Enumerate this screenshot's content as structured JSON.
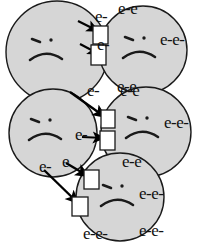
{
  "figure": {
    "background_color": "#ffffff",
    "width": 203,
    "height": 245
  },
  "style": {
    "circle_fill": "#d6d6d6",
    "circle_stroke": "#1a1a1a",
    "face_color": "#1a1a1a",
    "arrow_color": "#000000",
    "receptor_fill": "#ffffff",
    "receptor_stroke": "#1a1a1a",
    "label_color": "#111111"
  },
  "particles": [
    {
      "id": "particle-top-left",
      "name": "top-left-particle",
      "expression": "sad",
      "cx": 57,
      "cy": 52,
      "r": 51,
      "labels": [
        {
          "text": "e-",
          "x": 95,
          "y": 22,
          "size": "normal"
        },
        {
          "text": "e-",
          "x": 97,
          "y": 50,
          "size": "normal"
        },
        {
          "text": "e-",
          "x": 87,
          "y": 96,
          "size": "normal"
        }
      ]
    },
    {
      "id": "particle-top-right",
      "name": "top-right-particle",
      "expression": "sad",
      "cx": 143,
      "cy": 50,
      "r": 44,
      "labels": [
        {
          "text": "e-e",
          "x": 118,
          "y": 14,
          "size": "normal"
        },
        {
          "text": "e-e-",
          "x": 160,
          "y": 45,
          "size": "normal"
        },
        {
          "text": "e-e",
          "x": 117,
          "y": 92,
          "size": "normal"
        }
      ]
    },
    {
      "id": "particle-middle-left",
      "name": "middle-left-particle",
      "expression": "sad",
      "cx": 53,
      "cy": 133,
      "r": 44,
      "labels": [
        {
          "text": "e-",
          "x": 75,
          "y": 140,
          "size": "normal"
        },
        {
          "text": "e-",
          "x": 39,
          "y": 172,
          "size": "normal"
        },
        {
          "text": "e",
          "x": 62,
          "y": 167,
          "size": "normal"
        }
      ]
    },
    {
      "id": "particle-middle-right",
      "name": "middle-right-particle",
      "expression": "sad",
      "cx": 146,
      "cy": 132,
      "r": 45,
      "labels": [
        {
          "text": "e-e",
          "x": 120,
          "y": 96,
          "size": "normal"
        },
        {
          "text": "e-e-",
          "x": 164,
          "y": 128,
          "size": "normal"
        },
        {
          "text": "e-e",
          "x": 122,
          "y": 167,
          "size": "normal"
        }
      ]
    },
    {
      "id": "particle-bottom",
      "name": "bottom-particle",
      "expression": "sad",
      "cx": 120,
      "cy": 197,
      "r": 44,
      "labels": [
        {
          "text": "e-e-",
          "x": 139,
          "y": 199,
          "size": "normal"
        },
        {
          "text": "e-e-",
          "x": 83,
          "y": 239,
          "size": "normal"
        },
        {
          "text": "e-e-",
          "x": 139,
          "y": 236,
          "size": "normal"
        }
      ]
    }
  ],
  "receptors": [
    {
      "id": "receptor-1",
      "name": "receptor-box-top-right-upper",
      "x": 93,
      "y": 26,
      "w": 15,
      "h": 18
    },
    {
      "id": "receptor-2",
      "name": "receptor-box-top-right-lower",
      "x": 91,
      "y": 45,
      "w": 15,
      "h": 20
    },
    {
      "id": "receptor-3",
      "name": "receptor-box-middle-right-upper",
      "x": 101,
      "y": 110,
      "w": 14,
      "h": 18
    },
    {
      "id": "receptor-4",
      "name": "receptor-box-middle-right-lower",
      "x": 100,
      "y": 131,
      "w": 15,
      "h": 19
    },
    {
      "id": "receptor-5",
      "name": "receptor-box-bottom-upper",
      "x": 84,
      "y": 170,
      "w": 15,
      "h": 19
    },
    {
      "id": "receptor-6",
      "name": "receptor-box-bottom-lower",
      "x": 72,
      "y": 197,
      "w": 16,
      "h": 19
    }
  ],
  "transfers": [
    {
      "id": "transfer-1",
      "name": "electron-arrow-1",
      "from": "top-left-particle",
      "to": "top-right-particle",
      "x1": 78,
      "y1": 21,
      "x2": 98,
      "y2": 31
    },
    {
      "id": "transfer-2",
      "name": "electron-arrow-2",
      "from": "top-left-particle",
      "to": "top-right-particle",
      "x1": 80,
      "y1": 44,
      "x2": 99,
      "y2": 54
    },
    {
      "id": "transfer-3",
      "name": "electron-arrow-3",
      "from": "top-left-particle",
      "to": "middle-right-particle",
      "x1": 70,
      "y1": 92,
      "x2": 105,
      "y2": 117
    },
    {
      "id": "transfer-4",
      "name": "electron-arrow-4",
      "from": "middle-left-particle",
      "to": "middle-right-particle",
      "x1": 82,
      "y1": 137,
      "x2": 104,
      "y2": 138
    },
    {
      "id": "transfer-5",
      "name": "electron-arrow-5",
      "from": "middle-left-particle",
      "to": "bottom-particle",
      "x1": 66,
      "y1": 163,
      "x2": 88,
      "y2": 176
    },
    {
      "id": "transfer-6",
      "name": "electron-arrow-6",
      "from": "middle-left-particle",
      "to": "bottom-particle",
      "x1": 44,
      "y1": 170,
      "x2": 78,
      "y2": 203
    }
  ]
}
